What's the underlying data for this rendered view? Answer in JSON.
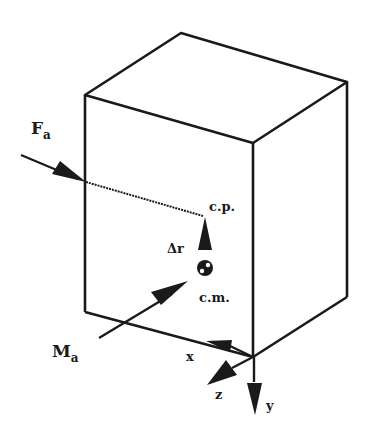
{
  "diagram": {
    "type": "free-body diagram of a rigid block",
    "colors": {
      "stroke": "#1a1a1a",
      "background": "#ffffff"
    },
    "labels": {
      "force": {
        "main": "F",
        "sub": "a"
      },
      "moment": {
        "main": "M",
        "sub": "a"
      },
      "center_of_pressure": "c.p.",
      "center_of_mass": "c.m.",
      "offset": "Δr",
      "axis_x": "x",
      "axis_y": "y",
      "axis_z": "z"
    },
    "elements": [
      "cube (3 visible faces)",
      "applied force arrow F_a with dotted line of action to c.p.",
      "offset vector Δr from c.m. to c.p.",
      "center of mass symbol",
      "applied moment arrow M_a pointing toward c.m.",
      "body axes x, y, z at bottom front corner"
    ]
  }
}
